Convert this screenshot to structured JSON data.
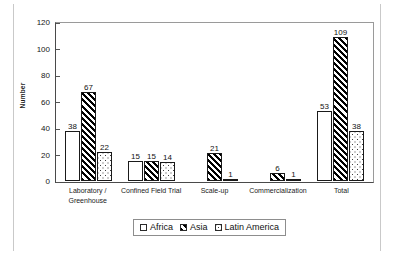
{
  "chart_data": {
    "type": "bar",
    "title": "",
    "subtitle": "",
    "xlabel": "",
    "ylabel": "Number",
    "ylim": [
      0,
      120
    ],
    "yticks": [
      0,
      20,
      40,
      60,
      80,
      100,
      120
    ],
    "grid": false,
    "legend_position": "bottom",
    "categories": [
      "Laboratory / Greenhouse",
      "Confined Field Trial",
      "Scale-up",
      "Commercialization",
      "Total"
    ],
    "category_lines": [
      [
        "Laboratory /",
        "Greenhouse"
      ],
      [
        "Confined Field Trial"
      ],
      [
        "Scale-up"
      ],
      [
        "Commercialization"
      ],
      [
        "Total"
      ]
    ],
    "series": [
      {
        "name": "Africa",
        "pattern": "solid-white",
        "values": [
          38,
          15,
          0,
          0,
          53
        ],
        "labels": [
          "38",
          "15",
          "",
          "",
          "53"
        ]
      },
      {
        "name": "Asia",
        "pattern": "diagonal-hatch",
        "values": [
          67,
          15,
          21,
          6,
          109
        ],
        "labels": [
          "67",
          "15",
          "21",
          "6",
          "109"
        ]
      },
      {
        "name": "Latin America",
        "pattern": "dotted",
        "values": [
          22,
          14,
          1,
          1,
          38
        ],
        "labels": [
          "22",
          "14",
          "1",
          "1",
          "38"
        ]
      }
    ]
  },
  "legend": {
    "items": [
      {
        "label": "Africa",
        "pattern": "solid-white"
      },
      {
        "label": "Asia",
        "pattern": "diagonal-hatch"
      },
      {
        "label": "Latin America",
        "pattern": "dotted"
      }
    ]
  },
  "colors": {
    "axis": "#4a4a4a",
    "text": "#111111",
    "bar_outline": "#1a1a1a",
    "background": "#ffffff"
  }
}
